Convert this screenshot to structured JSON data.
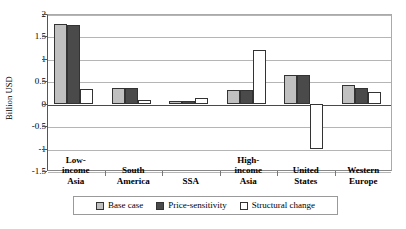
{
  "chart_data": {
    "type": "bar",
    "title": "",
    "xlabel": "",
    "ylabel": "Billion USD",
    "ylim": [
      -1.5,
      2
    ],
    "yticks": [
      2,
      1.5,
      1,
      0.5,
      0,
      -0.5,
      -1,
      -1.5
    ],
    "ytick_labels": [
      "2",
      "1.5",
      "1",
      "0.5",
      "0",
      "-0.5",
      "-1",
      "-1.5"
    ],
    "grid": true,
    "legend_position": "bottom",
    "categories": [
      "Low-\nincome\nAsia",
      "South\nAmerica",
      "SSA",
      "High-\nincome\nAsia",
      "United\nStates",
      "Western\nEurope"
    ],
    "series": [
      {
        "name": "Base case",
        "color": "#c0c0c0",
        "values": [
          1.77,
          0.34,
          0.07,
          0.3,
          0.65,
          0.42
        ]
      },
      {
        "name": "Price-sensitivity",
        "color": "#4a4a4a",
        "values": [
          1.75,
          0.34,
          0.07,
          0.3,
          0.64,
          0.35
        ]
      },
      {
        "name": "Structural change",
        "color": "#ffffff",
        "values": [
          0.33,
          0.09,
          0.12,
          1.2,
          -1.02,
          0.27
        ]
      }
    ]
  }
}
